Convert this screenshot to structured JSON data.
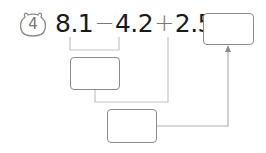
{
  "problem": {
    "number": "4",
    "badge_icon": "bear-face-icon",
    "expression": {
      "term1": "8.1",
      "op1": "−",
      "term2": "4.2",
      "op2": "+",
      "term3": "2.5",
      "equals": "="
    },
    "answer_box": {
      "value": ""
    },
    "step_boxes": [
      {
        "label": "result of 8.1 − 4.2",
        "value": ""
      },
      {
        "label": "result of step + 2.5",
        "value": ""
      }
    ]
  },
  "colors": {
    "text": "#1a1a1a",
    "operator": "#777777",
    "box_border": "#8c8c8c",
    "connector": "#b5b5b5",
    "arrow": "#8c8c8c"
  }
}
